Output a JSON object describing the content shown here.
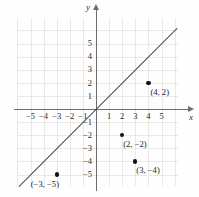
{
  "figure": {
    "type": "coordinate-plane",
    "axis_labels": {
      "x": "x",
      "y": "y"
    }
  },
  "chart_data": {
    "type": "scatter",
    "title": "",
    "xlabel": "x",
    "ylabel": "y",
    "xlim": [
      -6,
      6
    ],
    "ylim": [
      -6,
      6
    ],
    "grid": true,
    "legend": "none",
    "x_ticks": [
      "-5",
      "-4",
      "-3",
      "-2",
      "-1",
      "1",
      "2",
      "3",
      "4",
      "5"
    ],
    "y_ticks": [
      "5",
      "4",
      "3",
      "2",
      "1",
      "-1",
      "-2",
      "-3",
      "-4",
      "-5"
    ],
    "x_tick_values": [
      -5,
      -4,
      -3,
      -2,
      -1,
      1,
      2,
      3,
      4,
      5
    ],
    "y_tick_values": [
      5,
      4,
      3,
      2,
      1,
      -1,
      -2,
      -3,
      -4,
      -5
    ],
    "series": [
      {
        "name": "line",
        "type": "line",
        "equation": "y = x",
        "slope": 1,
        "intercept": 0,
        "x_range": [
          -6.2,
          6.2
        ]
      },
      {
        "name": "points",
        "type": "scatter",
        "points": [
          {
            "x": 4,
            "y": 2,
            "label": "(4, −2)PLACEHOLDER"
          },
          {
            "x": 2,
            "y": -2,
            "label": "(2, −2)"
          },
          {
            "x": 3,
            "y": -4,
            "label": "(3, −4)"
          },
          {
            "x": -3,
            "y": -5,
            "label": "(−3, −5)"
          }
        ]
      }
    ]
  },
  "points": [
    {
      "id": "p1",
      "x": 4,
      "y": 2,
      "label": "(4, 2)"
    },
    {
      "id": "p2",
      "x": 2,
      "y": -2,
      "label": "(2, −2)"
    },
    {
      "id": "p3",
      "x": 3,
      "y": -4,
      "label": "(3, −4)"
    },
    {
      "id": "p4",
      "x": -3,
      "y": -5,
      "label": "(−3, −5)"
    }
  ],
  "x_ticks": [
    {
      "v": -5,
      "label": "−5"
    },
    {
      "v": -4,
      "label": "−4"
    },
    {
      "v": -3,
      "label": "−3"
    },
    {
      "v": -2,
      "label": "−2"
    },
    {
      "v": -1,
      "label": "−1"
    },
    {
      "v": 1,
      "label": "1"
    },
    {
      "v": 2,
      "label": "2"
    },
    {
      "v": 3,
      "label": "3"
    },
    {
      "v": 4,
      "label": "4"
    },
    {
      "v": 5,
      "label": "5"
    }
  ],
  "y_ticks": [
    {
      "v": 5,
      "label": "5"
    },
    {
      "v": 4,
      "label": "4"
    },
    {
      "v": 3,
      "label": "3"
    },
    {
      "v": 2,
      "label": "2"
    },
    {
      "v": 1,
      "label": "1"
    },
    {
      "v": -1,
      "label": "−1"
    },
    {
      "v": -2,
      "label": "−2"
    },
    {
      "v": -3,
      "label": "−3"
    },
    {
      "v": -4,
      "label": "−4"
    },
    {
      "v": -5,
      "label": "−5"
    }
  ],
  "colors": {
    "grid": "#e9e9e9",
    "axis": "#6d6d6d",
    "line": "#4a4a4a",
    "dot": "#111111",
    "text": "#1d1d1d",
    "background": "#fefefe"
  }
}
